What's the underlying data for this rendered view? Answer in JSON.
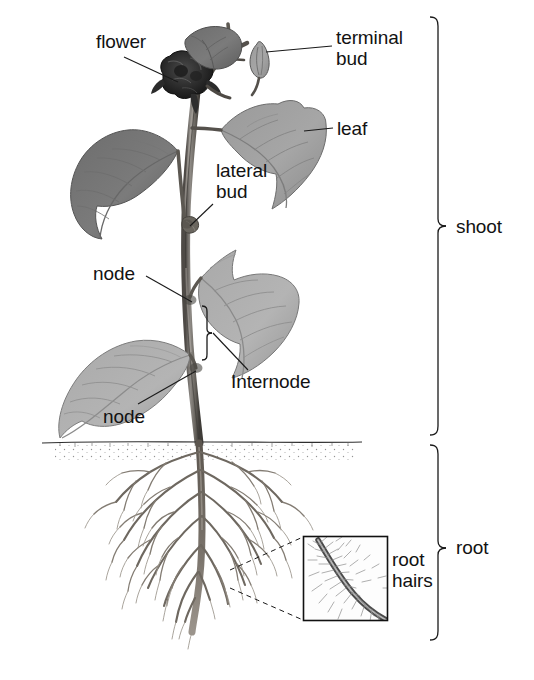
{
  "figure": {
    "background_color": "#ffffff",
    "text_color": "#121212",
    "line_color": "#1a1a1a"
  },
  "labels": {
    "flower": "flower",
    "terminal_bud_line1": "terminal",
    "terminal_bud_line2": "bud",
    "leaf": "leaf",
    "lateral_bud_line1": "lateral",
    "lateral_bud_line2": "bud",
    "node_upper": "node",
    "node_lower": "node",
    "internode": "Internode",
    "shoot": "shoot",
    "root": "root",
    "root_hairs_line1": "root",
    "root_hairs_line2": "hairs"
  },
  "brackets": {
    "shoot": {
      "label": "shoot",
      "top": 16,
      "bottom": 436,
      "x": 438
    },
    "root": {
      "label": "root",
      "top": 444,
      "bottom": 641,
      "x": 438
    },
    "internode": {
      "label": "Internode",
      "top": 305,
      "bottom": 361,
      "x": 207
    }
  },
  "inset": {
    "name": "root-hairs-magnification",
    "label_line1": "root",
    "label_line2": "hairs",
    "box": {
      "x": 303,
      "y": 536,
      "width": 85,
      "height": 85
    }
  },
  "soil_line": {
    "y": 443,
    "x_start": 42,
    "x_end": 362
  },
  "parts": [
    "flower",
    "terminal bud",
    "leaf",
    "lateral bud",
    "node",
    "Internode",
    "root hairs"
  ],
  "systems": [
    "shoot",
    "root"
  ]
}
